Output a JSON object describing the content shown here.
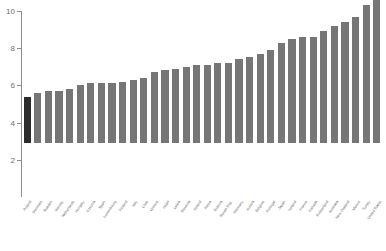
{
  "chart_data": {
    "type": "bar",
    "title": "",
    "subtitle": "",
    "xlabel": "",
    "ylabel": "",
    "ylim": [
      0,
      10
    ],
    "y_ticks": [
      0,
      2,
      4,
      6,
      8,
      10
    ],
    "y_tick_labels": [
      "0",
      "2",
      "4",
      "6",
      "8",
      "10"
    ],
    "grid": false,
    "legend": null,
    "legend_position": "none",
    "sorted": "ascending",
    "highlight_index": 0,
    "bar_count": 34,
    "categories": [
      "Poland",
      "Denmark",
      "Sweden",
      "Norway",
      "Netherlands",
      "Hungary",
      "Czechia",
      "Spain",
      "Luxembourg",
      "Finland",
      "Italy",
      "Chile",
      "Greece",
      "Israel",
      "Latvia",
      "Slovenia",
      "Ireland",
      "Korea",
      "Estonia",
      "Slovak Rep.",
      "Germany",
      "Austria",
      "Belgium",
      "Portugal",
      "Japan",
      "Iceland",
      "France",
      "Canada",
      "Switzerland",
      "Australia",
      "New Zealand",
      "Mexico",
      "Turkey",
      "United States"
    ],
    "values": [
      2.5,
      2.7,
      2.8,
      2.8,
      2.9,
      3.1,
      3.2,
      3.2,
      3.2,
      3.3,
      3.4,
      3.5,
      3.8,
      3.9,
      4.0,
      4.1,
      4.2,
      4.2,
      4.3,
      4.3,
      4.5,
      4.6,
      4.8,
      5.0,
      5.4,
      5.6,
      5.7,
      5.7,
      6.0,
      6.3,
      6.5,
      6.8,
      7.4,
      8.5
    ],
    "colors": {
      "bar": "#767676",
      "highlight_bar": "#2b2b2b",
      "axis": "#8c8c8c",
      "tick_label": "#6e6e6e",
      "category_label": "#5a5a5a",
      "background": "#ffffff"
    }
  }
}
